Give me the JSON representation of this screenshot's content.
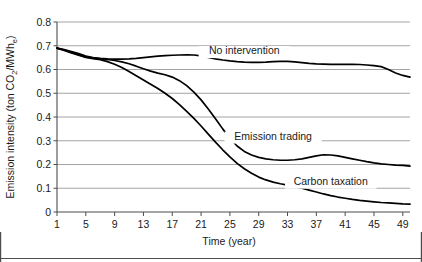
{
  "chart_data": {
    "type": "line",
    "title": "",
    "xlabel": "Time (year)",
    "ylabel": "Emission intensity (ton CO2/MWhe)",
    "ylabel_parts": {
      "prefix": "Emission intensity (ton CO",
      "sub1": "2",
      "middle": "/MWh",
      "sub2": "e",
      "suffix": ")"
    },
    "xlim": [
      1,
      50
    ],
    "ylim": [
      0,
      0.8
    ],
    "grid": true,
    "grid_axis": "y",
    "legend_position": "inline-annotations",
    "xticks": [
      1,
      5,
      9,
      13,
      17,
      21,
      25,
      29,
      33,
      37,
      41,
      45,
      49
    ],
    "xtick_labels": [
      "1",
      "5",
      "9",
      "13",
      "17",
      "21",
      "25",
      "29",
      "33",
      "37",
      "41",
      "45",
      "49"
    ],
    "yticks": [
      0,
      0.1,
      0.2,
      0.3,
      0.4,
      0.5,
      0.6,
      0.7,
      0.8
    ],
    "ytick_labels": [
      "0",
      "0.1",
      "0.2",
      "0.3",
      "0.4",
      "0.5",
      "0.6",
      "0.7",
      "0.8"
    ],
    "x": [
      1,
      2,
      3,
      4,
      5,
      6,
      7,
      8,
      9,
      10,
      11,
      12,
      13,
      14,
      15,
      16,
      17,
      18,
      19,
      20,
      21,
      22,
      23,
      24,
      25,
      26,
      27,
      28,
      29,
      30,
      31,
      32,
      33,
      34,
      35,
      36,
      37,
      38,
      39,
      40,
      41,
      42,
      43,
      44,
      45,
      46,
      47,
      48,
      49,
      50
    ],
    "series": [
      {
        "name": "No intervention",
        "color": "#000000",
        "label_x": 27,
        "label_y": 0.665,
        "values": [
          0.69,
          0.684,
          0.676,
          0.667,
          0.657,
          0.65,
          0.647,
          0.645,
          0.644,
          0.644,
          0.645,
          0.647,
          0.65,
          0.653,
          0.656,
          0.658,
          0.66,
          0.661,
          0.662,
          0.661,
          0.657,
          0.651,
          0.645,
          0.64,
          0.636,
          0.633,
          0.631,
          0.63,
          0.63,
          0.631,
          0.633,
          0.634,
          0.634,
          0.632,
          0.629,
          0.626,
          0.624,
          0.623,
          0.622,
          0.622,
          0.622,
          0.622,
          0.621,
          0.619,
          0.616,
          0.612,
          0.6,
          0.585,
          0.575,
          0.568
        ]
      },
      {
        "name": "Emission trading",
        "color": "#000000",
        "label_x": 31,
        "label_y": 0.305,
        "values": [
          0.69,
          0.682,
          0.672,
          0.662,
          0.653,
          0.648,
          0.645,
          0.642,
          0.638,
          0.632,
          0.624,
          0.614,
          0.603,
          0.593,
          0.585,
          0.578,
          0.568,
          0.553,
          0.532,
          0.505,
          0.472,
          0.434,
          0.393,
          0.35,
          0.31,
          0.278,
          0.255,
          0.24,
          0.23,
          0.224,
          0.22,
          0.218,
          0.218,
          0.22,
          0.224,
          0.23,
          0.236,
          0.241,
          0.24,
          0.236,
          0.23,
          0.224,
          0.218,
          0.212,
          0.207,
          0.203,
          0.2,
          0.197,
          0.196,
          0.193
        ]
      },
      {
        "name": "Carbon taxation",
        "color": "#000000",
        "label_x": 39,
        "label_y": 0.115,
        "values": [
          0.69,
          0.68,
          0.67,
          0.66,
          0.651,
          0.646,
          0.641,
          0.633,
          0.622,
          0.608,
          0.592,
          0.574,
          0.556,
          0.538,
          0.52,
          0.5,
          0.478,
          0.452,
          0.424,
          0.394,
          0.362,
          0.328,
          0.294,
          0.262,
          0.232,
          0.205,
          0.182,
          0.163,
          0.147,
          0.135,
          0.126,
          0.119,
          0.113,
          0.107,
          0.1,
          0.092,
          0.084,
          0.076,
          0.069,
          0.063,
          0.058,
          0.053,
          0.049,
          0.046,
          0.043,
          0.04,
          0.038,
          0.036,
          0.034,
          0.033
        ]
      }
    ],
    "annotations": [
      {
        "text": "No intervention",
        "x": 27,
        "y": 0.665
      },
      {
        "text": "Emission trading",
        "x": 31,
        "y": 0.305
      },
      {
        "text": "Carbon taxation",
        "x": 39,
        "y": 0.115
      }
    ]
  },
  "style": {
    "background": "#ffffff",
    "line_color": "#000000",
    "grid_color": "#9a9a9a",
    "axis_color": "#4d4d4d",
    "text_color": "#1a1a1a",
    "frame_color": "#4d4d4d"
  }
}
